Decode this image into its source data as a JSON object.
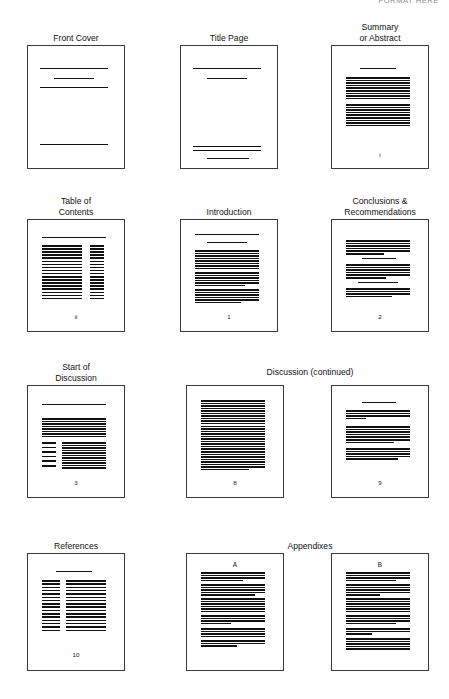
{
  "header": {
    "clipped_text": "FORMAT HERE"
  },
  "diagram": {
    "title_hidden": "",
    "group_captions": [
      {
        "label": "Discussion (continued)",
        "x": 170,
        "y": 367,
        "width": 280
      },
      {
        "label": "Appendixes",
        "x": 170,
        "y": 541,
        "width": 280
      }
    ],
    "pages": [
      {
        "id": "front-cover",
        "caption": "Front Cover",
        "folio": "",
        "sheet_label": "",
        "box": {
          "x": 27,
          "y": 45,
          "width": 98,
          "height": 124
        },
        "lines": [
          {
            "x": 12,
            "y": 22,
            "w": 68,
            "h": 1.2
          },
          {
            "x": 26,
            "y": 32,
            "w": 40,
            "h": 1.2
          },
          {
            "x": 12,
            "y": 41,
            "w": 68,
            "h": 1.4
          },
          {
            "x": 12,
            "y": 98,
            "w": 68,
            "h": 1.2
          }
        ]
      },
      {
        "id": "title-page",
        "caption": "Title Page",
        "folio": "",
        "sheet_label": "",
        "box": {
          "x": 180,
          "y": 45,
          "width": 98,
          "height": 124
        },
        "lines": [
          {
            "x": 12,
            "y": 22,
            "w": 68,
            "h": 1.2
          },
          {
            "x": 26,
            "y": 32,
            "w": 40,
            "h": 1.2
          },
          {
            "x": 12,
            "y": 100,
            "w": 68,
            "h": 1.3
          },
          {
            "x": 12,
            "y": 104,
            "w": 68,
            "h": 1.3
          },
          {
            "x": 26,
            "y": 112,
            "w": 42,
            "h": 1.2
          }
        ]
      },
      {
        "id": "summary-abstract",
        "caption": "Summary\nor Abstract",
        "folio": "i",
        "sheet_label": "",
        "box": {
          "x": 331,
          "y": 45,
          "width": 98,
          "height": 124
        },
        "folio_y": 105,
        "blocks": [
          {
            "x": 28,
            "y": 22,
            "w": 36,
            "lines": 1,
            "gap": 3.1,
            "h": 1.2,
            "last": 36
          },
          {
            "x": 14,
            "y": 31,
            "w": 64,
            "lines": 9,
            "gap": 2.6,
            "h": 1.5,
            "last": 64
          },
          {
            "x": 14,
            "y": 58,
            "w": 64,
            "lines": 9,
            "gap": 2.6,
            "h": 1.5,
            "last": 64
          }
        ]
      },
      {
        "id": "table-of-contents",
        "caption": "Table of\nContents",
        "folio": "ii",
        "sheet_label": "",
        "box": {
          "x": 27,
          "y": 219,
          "width": 98,
          "height": 113
        },
        "folio_y": 93,
        "lines": [
          {
            "x": 14,
            "y": 17,
            "w": 64,
            "h": 1.2
          }
        ],
        "blocks": [
          {
            "x": 14,
            "y": 25,
            "w": 40,
            "lines": 18,
            "gap": 3.1,
            "h": 1.5,
            "last": 40
          },
          {
            "x": 62,
            "y": 25,
            "w": 14,
            "lines": 18,
            "gap": 3.1,
            "h": 1.5,
            "last": 14
          }
        ]
      },
      {
        "id": "introduction",
        "caption": "Introduction",
        "folio": "1",
        "sheet_label": "",
        "box": {
          "x": 180,
          "y": 219,
          "width": 98,
          "height": 113
        },
        "folio_y": 93,
        "lines": [
          {
            "x": 14,
            "y": 14,
            "w": 64,
            "h": 1.2
          },
          {
            "x": 26,
            "y": 22,
            "w": 40,
            "h": 1.2
          }
        ],
        "blocks": [
          {
            "x": 14,
            "y": 30,
            "w": 64,
            "lines": 8,
            "gap": 2.5,
            "h": 1.5,
            "last": 64
          },
          {
            "x": 14,
            "y": 52,
            "w": 64,
            "lines": 6,
            "gap": 2.5,
            "h": 1.5,
            "last": 50
          },
          {
            "x": 14,
            "y": 69,
            "w": 64,
            "lines": 6,
            "gap": 2.5,
            "h": 1.5,
            "last": 46
          }
        ]
      },
      {
        "id": "conclusions-recommendations",
        "caption": "Conclusions &\nRecommendations",
        "folio": "2",
        "sheet_label": "",
        "box": {
          "x": 331,
          "y": 219,
          "width": 98,
          "height": 113
        },
        "folio_y": 93,
        "blocks": [
          {
            "x": 14,
            "y": 20,
            "w": 64,
            "lines": 6,
            "gap": 2.6,
            "h": 1.5,
            "last": 38
          },
          {
            "x": 30,
            "y": 38,
            "w": 34,
            "lines": 1,
            "gap": 2.6,
            "h": 1.3,
            "last": 34
          },
          {
            "x": 14,
            "y": 44,
            "w": 64,
            "lines": 6,
            "gap": 2.6,
            "h": 1.5,
            "last": 40
          },
          {
            "x": 26,
            "y": 62,
            "w": 40,
            "lines": 1,
            "gap": 2.6,
            "h": 1.3,
            "last": 40
          },
          {
            "x": 14,
            "y": 68,
            "w": 64,
            "lines": 4,
            "gap": 2.6,
            "h": 1.5,
            "last": 46
          }
        ]
      },
      {
        "id": "start-of-discussion",
        "caption": "Start of\nDiscussion",
        "folio": "3",
        "sheet_label": "",
        "box": {
          "x": 27,
          "y": 385,
          "width": 98,
          "height": 113
        },
        "folio_y": 93,
        "lines": [
          {
            "x": 14,
            "y": 18,
            "w": 64,
            "h": 1.2
          }
        ],
        "blocks": [
          {
            "x": 14,
            "y": 32,
            "w": 64,
            "lines": 8,
            "gap": 2.5,
            "h": 1.5,
            "last": 64
          },
          {
            "x": 14,
            "y": 56,
            "w": 14,
            "lines": 6,
            "gap": 4.6,
            "h": 1.6,
            "last": 14
          },
          {
            "x": 34,
            "y": 56,
            "w": 44,
            "lines": 11,
            "gap": 2.5,
            "h": 1.5,
            "last": 44
          }
        ]
      },
      {
        "id": "discussion-page-8",
        "caption": "",
        "folio": "8",
        "sheet_label": "",
        "box": {
          "x": 186,
          "y": 385,
          "width": 98,
          "height": 113
        },
        "folio_y": 93,
        "blocks": [
          {
            "x": 14,
            "y": 14,
            "w": 64,
            "lines": 28,
            "gap": 2.55,
            "h": 1.5,
            "last": 48
          }
        ]
      },
      {
        "id": "discussion-page-9",
        "caption": "",
        "folio": "9",
        "sheet_label": "",
        "box": {
          "x": 331,
          "y": 385,
          "width": 98,
          "height": 113
        },
        "folio_y": 93,
        "lines": [
          {
            "x": 30,
            "y": 16,
            "w": 34,
            "h": 1.2
          }
        ],
        "blocks": [
          {
            "x": 14,
            "y": 24,
            "w": 64,
            "lines": 4,
            "gap": 2.6,
            "h": 1.5,
            "last": 20
          },
          {
            "x": 14,
            "y": 40,
            "w": 64,
            "lines": 7,
            "gap": 2.6,
            "h": 1.5,
            "last": 48
          },
          {
            "x": 14,
            "y": 62,
            "w": 64,
            "lines": 5,
            "gap": 2.6,
            "h": 1.5,
            "last": 52
          }
        ]
      },
      {
        "id": "references",
        "caption": "References",
        "folio": "10",
        "sheet_label": "",
        "box": {
          "x": 27,
          "y": 553,
          "width": 98,
          "height": 118
        },
        "folio_y": 97,
        "lines": [
          {
            "x": 28,
            "y": 17,
            "w": 36,
            "h": 1.3
          }
        ],
        "blocks": [
          {
            "x": 14,
            "y": 26,
            "w": 18,
            "lines": 16,
            "gap": 3.3,
            "h": 1.6,
            "last": 18
          },
          {
            "x": 38,
            "y": 26,
            "w": 40,
            "lines": 16,
            "gap": 3.3,
            "h": 1.6,
            "last": 40
          }
        ]
      },
      {
        "id": "appendix-a",
        "caption": "",
        "folio": "",
        "sheet_label": "A",
        "box": {
          "x": 186,
          "y": 553,
          "width": 98,
          "height": 118
        },
        "label_y": 7,
        "blocks": [
          {
            "x": 14,
            "y": 18,
            "w": 64,
            "lines": 4,
            "gap": 2.5,
            "h": 1.5,
            "last": 42
          },
          {
            "x": 14,
            "y": 30,
            "w": 64,
            "lines": 5,
            "gap": 2.5,
            "h": 1.5,
            "last": 54
          },
          {
            "x": 14,
            "y": 44,
            "w": 64,
            "lines": 6,
            "gap": 2.5,
            "h": 1.5,
            "last": 64
          },
          {
            "x": 14,
            "y": 61,
            "w": 64,
            "lines": 4,
            "gap": 2.5,
            "h": 1.5,
            "last": 30
          },
          {
            "x": 14,
            "y": 74,
            "w": 64,
            "lines": 4,
            "gap": 2.5,
            "h": 1.5,
            "last": 64
          },
          {
            "x": 14,
            "y": 86,
            "w": 64,
            "lines": 3,
            "gap": 2.5,
            "h": 1.5,
            "last": 36
          }
        ]
      },
      {
        "id": "appendix-b",
        "caption": "",
        "folio": "",
        "sheet_label": "B",
        "box": {
          "x": 331,
          "y": 553,
          "width": 98,
          "height": 118
        },
        "label_y": 7,
        "blocks": [
          {
            "x": 14,
            "y": 18,
            "w": 64,
            "lines": 4,
            "gap": 2.5,
            "h": 1.5,
            "last": 50
          },
          {
            "x": 14,
            "y": 30,
            "w": 64,
            "lines": 5,
            "gap": 2.5,
            "h": 1.5,
            "last": 34
          },
          {
            "x": 14,
            "y": 44,
            "w": 64,
            "lines": 6,
            "gap": 2.5,
            "h": 1.5,
            "last": 64
          },
          {
            "x": 14,
            "y": 61,
            "w": 64,
            "lines": 4,
            "gap": 2.5,
            "h": 1.5,
            "last": 50
          },
          {
            "x": 14,
            "y": 74,
            "w": 64,
            "lines": 3,
            "gap": 2.5,
            "h": 1.5,
            "last": 26
          },
          {
            "x": 14,
            "y": 84,
            "w": 64,
            "lines": 5,
            "gap": 2.5,
            "h": 1.5,
            "last": 64
          }
        ]
      }
    ]
  },
  "colors": {
    "ink": "#111111",
    "page_border": "#3a3a3a",
    "paper": "#ffffff",
    "faded_header": "#8d8d8d"
  }
}
